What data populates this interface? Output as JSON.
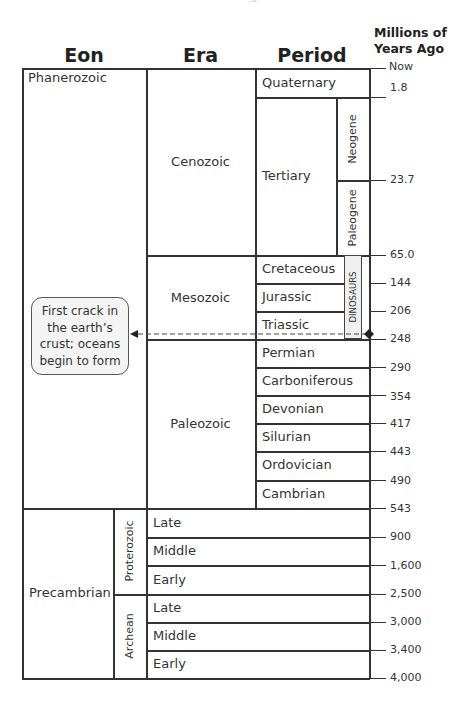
{
  "title": "Eons of Geologic Time",
  "headers": {
    "eon": "Eon",
    "era": "Era",
    "period": "Period",
    "mya_line1": "Millions of",
    "mya_line2": "Years Ago"
  },
  "eons": [
    {
      "name": "Phanerozoic"
    },
    {
      "name": "Precambrian"
    }
  ],
  "eras": [
    {
      "name": "Cenozoic"
    },
    {
      "name": "Mesozoic"
    },
    {
      "name": "Paleozoic"
    },
    {
      "name": "Proterozoic"
    },
    {
      "name": "Archean"
    }
  ],
  "periods": [
    {
      "name": "Quaternary"
    },
    {
      "name": "Tertiary"
    },
    {
      "name": "Cretaceous"
    },
    {
      "name": "Jurassic"
    },
    {
      "name": "Triassic"
    },
    {
      "name": "Permian"
    },
    {
      "name": "Carboniferous"
    },
    {
      "name": "Devonian"
    },
    {
      "name": "Silurian"
    },
    {
      "name": "Ordovician"
    },
    {
      "name": "Cambrian"
    },
    {
      "name": "Late"
    },
    {
      "name": "Middle"
    },
    {
      "name": "Early"
    },
    {
      "name": "Late"
    },
    {
      "name": "Middle"
    },
    {
      "name": "Early"
    }
  ],
  "epochs": [
    {
      "name": "Neogene"
    },
    {
      "name": "Paleogene"
    }
  ],
  "dinosaurs_label": "DINOSAURS",
  "callout": {
    "text_line1": "First crack in",
    "text_line2": "the earth’s",
    "text_line3": "crust; oceans",
    "text_line4": "begin to form"
  },
  "ticks": [
    {
      "label": "Now"
    },
    {
      "label": "1.8"
    },
    {
      "label": "23.7"
    },
    {
      "label": "65.0"
    },
    {
      "label": "144"
    },
    {
      "label": "206"
    },
    {
      "label": "248"
    },
    {
      "label": "290"
    },
    {
      "label": "354"
    },
    {
      "label": "417"
    },
    {
      "label": "443"
    },
    {
      "label": "490"
    },
    {
      "label": "543"
    },
    {
      "label": "900"
    },
    {
      "label": "1,600"
    },
    {
      "label": "2,500"
    },
    {
      "label": "3,000"
    },
    {
      "label": "3,400"
    },
    {
      "label": "4,000"
    }
  ]
}
